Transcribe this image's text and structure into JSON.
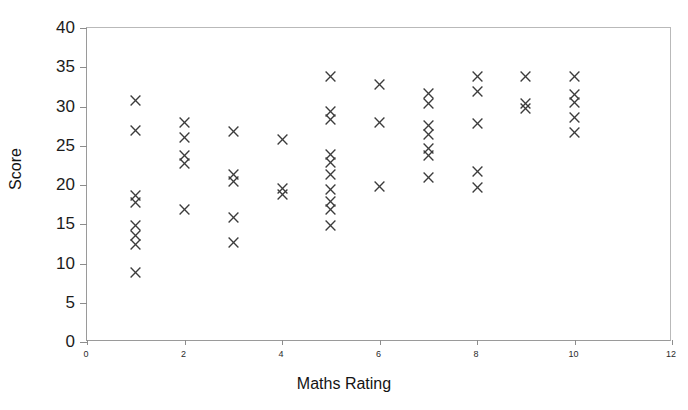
{
  "chart_data": {
    "type": "scatter",
    "title": "",
    "xlabel": "Maths Rating",
    "ylabel": "Score",
    "xlim": [
      0,
      12
    ],
    "ylim": [
      0,
      40
    ],
    "xticks": [
      0,
      2,
      4,
      6,
      8,
      10,
      12
    ],
    "yticks": [
      0,
      5,
      10,
      15,
      20,
      25,
      30,
      35,
      40
    ],
    "xtick_labels": [
      "0",
      "2",
      "4",
      "6",
      "8",
      "10",
      "12"
    ],
    "ytick_labels": [
      "0",
      "5",
      "10",
      "15",
      "20",
      "25",
      "30",
      "35",
      "40"
    ],
    "grid": false,
    "legend": false,
    "marker": "x",
    "marker_color": "#3c3c3c",
    "points": [
      {
        "x": 1,
        "y": 30.8
      },
      {
        "x": 1,
        "y": 26.9
      },
      {
        "x": 1,
        "y": 18.7
      },
      {
        "x": 1,
        "y": 17.8
      },
      {
        "x": 1,
        "y": 14.8
      },
      {
        "x": 1,
        "y": 13.6
      },
      {
        "x": 1,
        "y": 12.4
      },
      {
        "x": 1,
        "y": 8.9
      },
      {
        "x": 2,
        "y": 27.9
      },
      {
        "x": 2,
        "y": 26.1
      },
      {
        "x": 2,
        "y": 23.7
      },
      {
        "x": 2,
        "y": 22.8
      },
      {
        "x": 2,
        "y": 16.9
      },
      {
        "x": 3,
        "y": 26.8
      },
      {
        "x": 3,
        "y": 21.4
      },
      {
        "x": 3,
        "y": 20.4
      },
      {
        "x": 3,
        "y": 15.8
      },
      {
        "x": 3,
        "y": 12.7
      },
      {
        "x": 4,
        "y": 25.8
      },
      {
        "x": 4,
        "y": 19.5
      },
      {
        "x": 4,
        "y": 18.8
      },
      {
        "x": 5,
        "y": 33.8
      },
      {
        "x": 5,
        "y": 29.4
      },
      {
        "x": 5,
        "y": 28.4
      },
      {
        "x": 5,
        "y": 23.9
      },
      {
        "x": 5,
        "y": 22.9
      },
      {
        "x": 5,
        "y": 21.4
      },
      {
        "x": 5,
        "y": 19.4
      },
      {
        "x": 5,
        "y": 17.9
      },
      {
        "x": 5,
        "y": 16.9
      },
      {
        "x": 5,
        "y": 14.8
      },
      {
        "x": 6,
        "y": 32.8
      },
      {
        "x": 6,
        "y": 27.9
      },
      {
        "x": 6,
        "y": 19.8
      },
      {
        "x": 7,
        "y": 31.6
      },
      {
        "x": 7,
        "y": 30.4
      },
      {
        "x": 7,
        "y": 27.6
      },
      {
        "x": 7,
        "y": 26.4
      },
      {
        "x": 7,
        "y": 24.6
      },
      {
        "x": 7,
        "y": 23.8
      },
      {
        "x": 7,
        "y": 20.9
      },
      {
        "x": 8,
        "y": 33.8
      },
      {
        "x": 8,
        "y": 31.9
      },
      {
        "x": 8,
        "y": 27.8
      },
      {
        "x": 8,
        "y": 21.7
      },
      {
        "x": 8,
        "y": 19.7
      },
      {
        "x": 9,
        "y": 33.8
      },
      {
        "x": 9,
        "y": 30.4
      },
      {
        "x": 9,
        "y": 29.8
      },
      {
        "x": 10,
        "y": 33.8
      },
      {
        "x": 10,
        "y": 31.5
      },
      {
        "x": 10,
        "y": 30.5
      },
      {
        "x": 10,
        "y": 28.6
      },
      {
        "x": 10,
        "y": 26.7
      }
    ]
  }
}
